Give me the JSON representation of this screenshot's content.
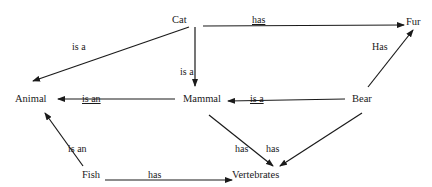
{
  "diagram": {
    "type": "semantic-network",
    "nodes": [
      {
        "id": "cat",
        "label": "Cat"
      },
      {
        "id": "fur",
        "label": "Fur"
      },
      {
        "id": "animal",
        "label": "Animal"
      },
      {
        "id": "mammal",
        "label": "Mammal"
      },
      {
        "id": "bear",
        "label": "Bear"
      },
      {
        "id": "fish",
        "label": "Fish"
      },
      {
        "id": "vertebrates",
        "label": "Vertebrates"
      }
    ],
    "edges": [
      {
        "from": "cat",
        "to": "fur",
        "label": "has"
      },
      {
        "from": "cat",
        "to": "animal",
        "label": "is a"
      },
      {
        "from": "cat",
        "to": "mammal",
        "label": "is a"
      },
      {
        "from": "bear",
        "to": "fur",
        "label": "Has"
      },
      {
        "from": "mammal",
        "to": "animal",
        "label": "is an"
      },
      {
        "from": "bear",
        "to": "mammal",
        "label": "is a"
      },
      {
        "from": "fish",
        "to": "animal",
        "label": "is an"
      },
      {
        "from": "mammal",
        "to": "vertebrates",
        "label": "has"
      },
      {
        "from": "bear",
        "to": "vertebrates",
        "label": "has"
      },
      {
        "from": "fish",
        "to": "vertebrates",
        "label": "has"
      }
    ]
  }
}
